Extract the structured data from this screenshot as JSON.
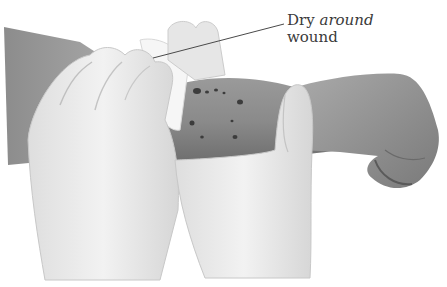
{
  "figure": {
    "palette": {
      "background": "#ffffff",
      "arm_dark": "#6e6e6e",
      "arm_mid": "#8f8f8f",
      "arm_light": "#a8a8a8",
      "glove": "#ececec",
      "glove_shadow": "#cfcfcf",
      "gauze": "#f6f6f6",
      "wound_mark": "#3c3c3c",
      "label_text": "#3a3a3a",
      "leader_line": "#4a4a4a"
    },
    "callout": {
      "line1_prefix": "Dry ",
      "line1_emphasis": "around",
      "line2": "wound",
      "leader_from": [
        153,
        58
      ],
      "leader_to": [
        284,
        24
      ]
    }
  }
}
